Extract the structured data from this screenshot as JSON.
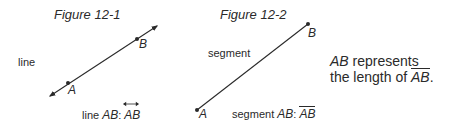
{
  "figure1": {
    "title": "Figure 12-1",
    "side_label": "line",
    "point_a": "A",
    "point_b": "B",
    "caption_prefix": "line",
    "caption_name": "AB",
    "caption_sep": ":",
    "caption_symbol": "AB"
  },
  "figure2": {
    "title": "Figure 12-2",
    "side_label": "segment",
    "point_a": "A",
    "point_b": "B",
    "caption_prefix": "segment",
    "caption_name": "AB",
    "caption_sep": ":",
    "caption_symbol": "AB"
  },
  "note": {
    "line1_italic": "AB",
    "line1_rest": " represents",
    "line2_prefix": "the length of ",
    "line2_symbol": "AB",
    "line2_suffix": "."
  },
  "colors": {
    "ink": "#2a2a2a",
    "background": "#ffffff"
  }
}
